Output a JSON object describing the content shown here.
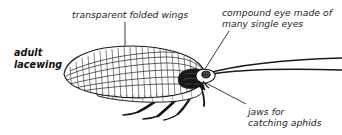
{
  "figure": {
    "subject": "adult lacewing",
    "background_color": "#ffffff",
    "ink_color": "#201d1c"
  },
  "labels": {
    "title": "adult\nlacewing",
    "wings": "transparent folded wings",
    "eye": "compound eye made of\nmany single eyes",
    "jaws": "jaws for\ncatching aphids"
  },
  "illustration": {
    "name": "lacewing-line-drawing",
    "parts": [
      "forewing-with-cross-veins",
      "hindwing",
      "thorax",
      "abdomen",
      "head-with-compound-eye",
      "antenna-upper",
      "antenna-lower",
      "legs"
    ]
  },
  "leader_lines": [
    {
      "name": "leader-wings",
      "from": "label-wings",
      "to": "forewing"
    },
    {
      "name": "leader-eye",
      "from": "label-eye",
      "to": "compound-eye"
    },
    {
      "name": "leader-jaws",
      "from": "label-jaws",
      "to": "jaws"
    }
  ]
}
